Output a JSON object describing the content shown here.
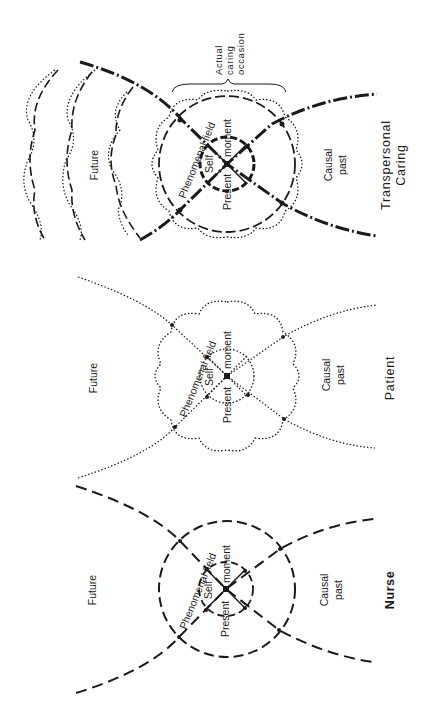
{
  "figure": {
    "orientation": "rotated 90 degrees counter-clockwise (text reads bottom-to-top)",
    "line_color": "#1a1a1a",
    "background": "#ffffff"
  },
  "panels": [
    {
      "id": "transpersonal",
      "title_line1": "Transpersonal",
      "title_line2": "Caring",
      "future_label": "Future",
      "past_label_line1": "Causal",
      "past_label_line2": "past",
      "field_label": "Phenomenal field",
      "self_label": "Self",
      "present_label": "Present",
      "moment_label": "moment",
      "brace_label_line1": "Actual",
      "brace_label_line2": "caring",
      "brace_label_line3": "occasion",
      "line_style": "heavy dashed + dotted overlay"
    },
    {
      "id": "patient",
      "title": "Patient",
      "future_label": "Future",
      "past_label_line1": "Causal",
      "past_label_line2": "past",
      "field_label": "Phenomenal field",
      "self_label": "Self",
      "present_label": "Present",
      "moment_label": "moment",
      "line_style": "dotted"
    },
    {
      "id": "nurse",
      "title": "Nurse",
      "future_label": "Future",
      "past_label_line1": "Causal",
      "past_label_line2": "past",
      "field_label": "Phenomenal field",
      "self_label": "Self",
      "present_label": "Present",
      "moment_label": "moment",
      "line_style": "dashed"
    }
  ]
}
